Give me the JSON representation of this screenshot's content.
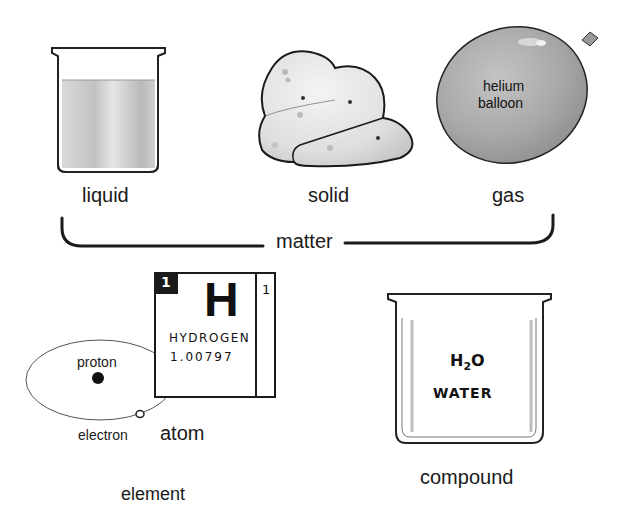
{
  "diagram": {
    "states_of_matter": [
      {
        "id": "liquid",
        "label": "liquid",
        "illustration": "beaker-with-liquid"
      },
      {
        "id": "solid",
        "label": "solid",
        "illustration": "rock-lump"
      },
      {
        "id": "gas",
        "label": "gas",
        "illustration": "balloon",
        "inner_label_line1": "helium",
        "inner_label_line2": "balloon"
      }
    ],
    "group_bracket": {
      "label": "matter"
    },
    "element": {
      "label": "element",
      "tile": {
        "atomic_number": "1",
        "symbol": "H",
        "name": "HYDROGEN",
        "atomic_mass": "1.00797",
        "side_number": "1"
      },
      "atom": {
        "label": "atom",
        "proton_label": "proton",
        "electron_label": "electron"
      }
    },
    "compound": {
      "label": "compound",
      "formula_main": "H",
      "formula_sub": "2",
      "formula_end": "O",
      "name": "WATER",
      "illustration": "empty-beaker"
    }
  },
  "colors": {
    "ink": "#111111",
    "liquid_gray": "#c8c8c8",
    "balloon_gray": "#a9a9a9",
    "rock_light": "#e6e6e6",
    "tile_dark": "#1a1a1a"
  }
}
